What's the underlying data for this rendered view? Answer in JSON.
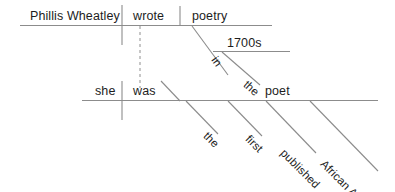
{
  "diagram": {
    "type": "reed-kellogg-sentence-diagram",
    "sentence": "Phillis Wheatley wrote poetry in the 1700s; she was the first published African American poet.",
    "line_color": "#8c8c8c",
    "text_color": "#1d1d1d",
    "background_color": "#ffffff",
    "clauses": [
      {
        "id": "clause-main",
        "subject": "Phillis Wheatley",
        "verb": "wrote",
        "direct_object": "poetry",
        "modifiers": [
          {
            "word": "in",
            "role": "preposition",
            "attached_to": "wrote"
          },
          {
            "word": "1700s",
            "role": "object-of-preposition",
            "attached_to": "in"
          },
          {
            "word": "the",
            "role": "article",
            "attached_to": "1700s"
          }
        ]
      },
      {
        "id": "clause-second",
        "subject": "she",
        "verb": "was",
        "predicate_nominative": "poet",
        "modifiers": [
          {
            "word": "the",
            "role": "article",
            "attached_to": "poet"
          },
          {
            "word": "first",
            "role": "adjective",
            "attached_to": "poet"
          },
          {
            "word": "published",
            "role": "adjective",
            "attached_to": "poet"
          },
          {
            "word": "African American",
            "role": "adjective",
            "attached_to": "poet"
          }
        ]
      }
    ],
    "labels": {
      "subject_main": "Phillis Wheatley",
      "verb_main": "wrote",
      "object_main": "poetry",
      "prep_in": "in",
      "prep_object_1700s": "1700s",
      "article_the_1700s": "the",
      "subject_second": "she",
      "verb_second": "was",
      "complement_poet": "poet",
      "adj_the": "the",
      "adj_first": "first",
      "adj_published": "published",
      "adj_african_american": "African American"
    }
  }
}
